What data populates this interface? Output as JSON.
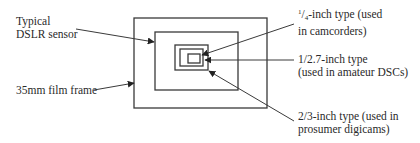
{
  "diagram": {
    "line_color": "#3a3a3a",
    "labels": {
      "dslr": {
        "line1": "Typical",
        "line2": "DSLR sensor"
      },
      "film": {
        "line1": "35mm film frame"
      },
      "quarter": {
        "frac_num": "1",
        "frac_den": "4",
        "line1_rest": "-inch type (used",
        "line2": "in camcorders)"
      },
      "one_over_2_7": {
        "line1": "1/2.7-inch type",
        "line2": "(used in amateur DSCs)"
      },
      "two_thirds": {
        "line1": "2/3-inch type (used in",
        "line2": "prosumer digicams)"
      }
    },
    "rects": [
      {
        "name": "35mm-film-frame",
        "x": 134,
        "y": 18,
        "w": 133,
        "h": 90
      },
      {
        "name": "dslr-sensor",
        "x": 155,
        "y": 32,
        "w": 83,
        "h": 58
      },
      {
        "name": "two-thirds-inch-sensor",
        "x": 175,
        "y": 45,
        "w": 33,
        "h": 25
      },
      {
        "name": "one-over-2-7-inch-sensor",
        "x": 180,
        "y": 49,
        "w": 23,
        "h": 17
      },
      {
        "name": "quarter-inch-sensor",
        "x": 188,
        "y": 54,
        "w": 12,
        "h": 9
      }
    ]
  }
}
